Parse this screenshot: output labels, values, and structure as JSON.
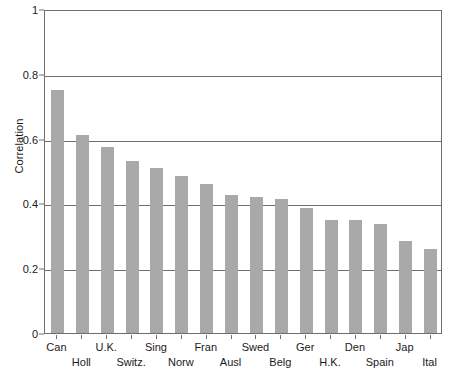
{
  "chart_data": {
    "type": "bar",
    "title": "",
    "xlabel": "",
    "ylabel": "Correlation",
    "ylim": [
      0,
      1
    ],
    "yticks": [
      0,
      0.2,
      0.4,
      0.6,
      0.8,
      1
    ],
    "ytick_labels": [
      "0",
      "0.2",
      "0.4",
      "0.6",
      "0.8",
      "1"
    ],
    "grid": true,
    "legend": null,
    "bar_color": "#a9a9a9",
    "axis_color": "#6e6e6e",
    "categories": [
      "Can",
      "Holl",
      "U.K.",
      "Switz.",
      "Sing",
      "Norw",
      "Fran",
      "Ausl",
      "Swed",
      "Belg",
      "Ger",
      "H.K.",
      "Den",
      "Spain",
      "Jap",
      "Ital"
    ],
    "values": [
      0.75,
      0.61,
      0.575,
      0.53,
      0.51,
      0.485,
      0.46,
      0.425,
      0.42,
      0.415,
      0.385,
      0.35,
      0.35,
      0.335,
      0.285,
      0.26
    ]
  }
}
